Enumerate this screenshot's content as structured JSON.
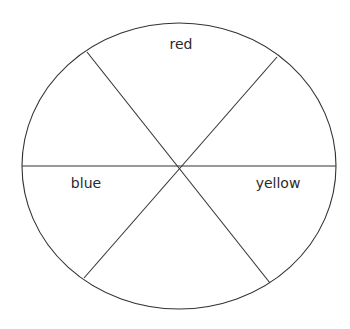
{
  "diagram": {
    "type": "color-wheel",
    "colors": {
      "background": "#ffffff",
      "stroke": "#333333",
      "text": "#2a2a2a"
    },
    "ellipse": {
      "cx": 179,
      "cy": 166,
      "rx": 157,
      "ry": 143
    },
    "center": {
      "x": 180,
      "y": 167
    },
    "spokes": [
      {
        "name": "horizontal",
        "x1": 22,
        "y1": 166,
        "x2": 336,
        "y2": 166
      },
      {
        "name": "upper-left-to-lower-right",
        "x1": 87,
        "y1": 52,
        "x2": 270,
        "y2": 283
      },
      {
        "name": "upper-right-to-lower-left",
        "x1": 277,
        "y1": 57,
        "x2": 84,
        "y2": 278
      }
    ],
    "segments": [
      {
        "position": "top",
        "label": "red"
      },
      {
        "position": "upper-right",
        "label": ""
      },
      {
        "position": "lower-right",
        "label": "yellow"
      },
      {
        "position": "bottom",
        "label": ""
      },
      {
        "position": "lower-left",
        "label": "blue"
      },
      {
        "position": "upper-left",
        "label": ""
      }
    ],
    "labels": {
      "red": "red",
      "blue": "blue",
      "yellow": "yellow"
    }
  }
}
